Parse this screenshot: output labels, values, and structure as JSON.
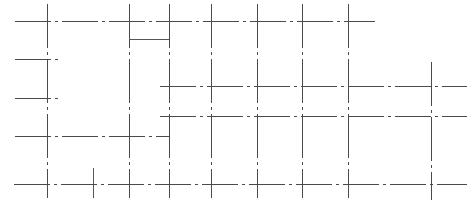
{
  "drawing": {
    "type": "structural-grid-plan",
    "line_color": "#4a4a4a",
    "background": "#ffffff",
    "vertical_axes": [
      {
        "id": "v1",
        "x": 47,
        "y1": 4,
        "y2": 198
      },
      {
        "id": "v2",
        "x": 129,
        "y1": 4,
        "y2": 198
      },
      {
        "id": "v3",
        "x": 169,
        "y1": 4,
        "y2": 198
      },
      {
        "id": "v4",
        "x": 211,
        "y1": 4,
        "y2": 198
      },
      {
        "id": "v5",
        "x": 257,
        "y1": 4,
        "y2": 198
      },
      {
        "id": "v6",
        "x": 302,
        "y1": 4,
        "y2": 198
      },
      {
        "id": "v7",
        "x": 348,
        "y1": 4,
        "y2": 198
      },
      {
        "id": "v8",
        "x": 431,
        "y1": 62,
        "y2": 200
      }
    ],
    "horizontal_axes": [
      {
        "id": "h1",
        "y": 21,
        "x1": 15,
        "x2": 375
      },
      {
        "id": "h2",
        "y": 59,
        "x1": 15,
        "x2": 60
      },
      {
        "id": "h3",
        "y": 86,
        "x1": 160,
        "x2": 467
      },
      {
        "id": "h4",
        "y": 98,
        "x1": 15,
        "x2": 60
      },
      {
        "id": "h5",
        "y": 116,
        "x1": 160,
        "x2": 467
      },
      {
        "id": "h6",
        "y": 136,
        "x1": 15,
        "x2": 169
      },
      {
        "id": "h7",
        "y": 184,
        "x1": 14,
        "x2": 467
      }
    ],
    "solid_segments": [
      {
        "id": "box-bottom",
        "x1": 129,
        "y1": 39,
        "x2": 169,
        "y2": 39
      },
      {
        "id": "short-vertical",
        "x1": 93,
        "y1": 168,
        "x2": 93,
        "y2": 198
      }
    ]
  }
}
